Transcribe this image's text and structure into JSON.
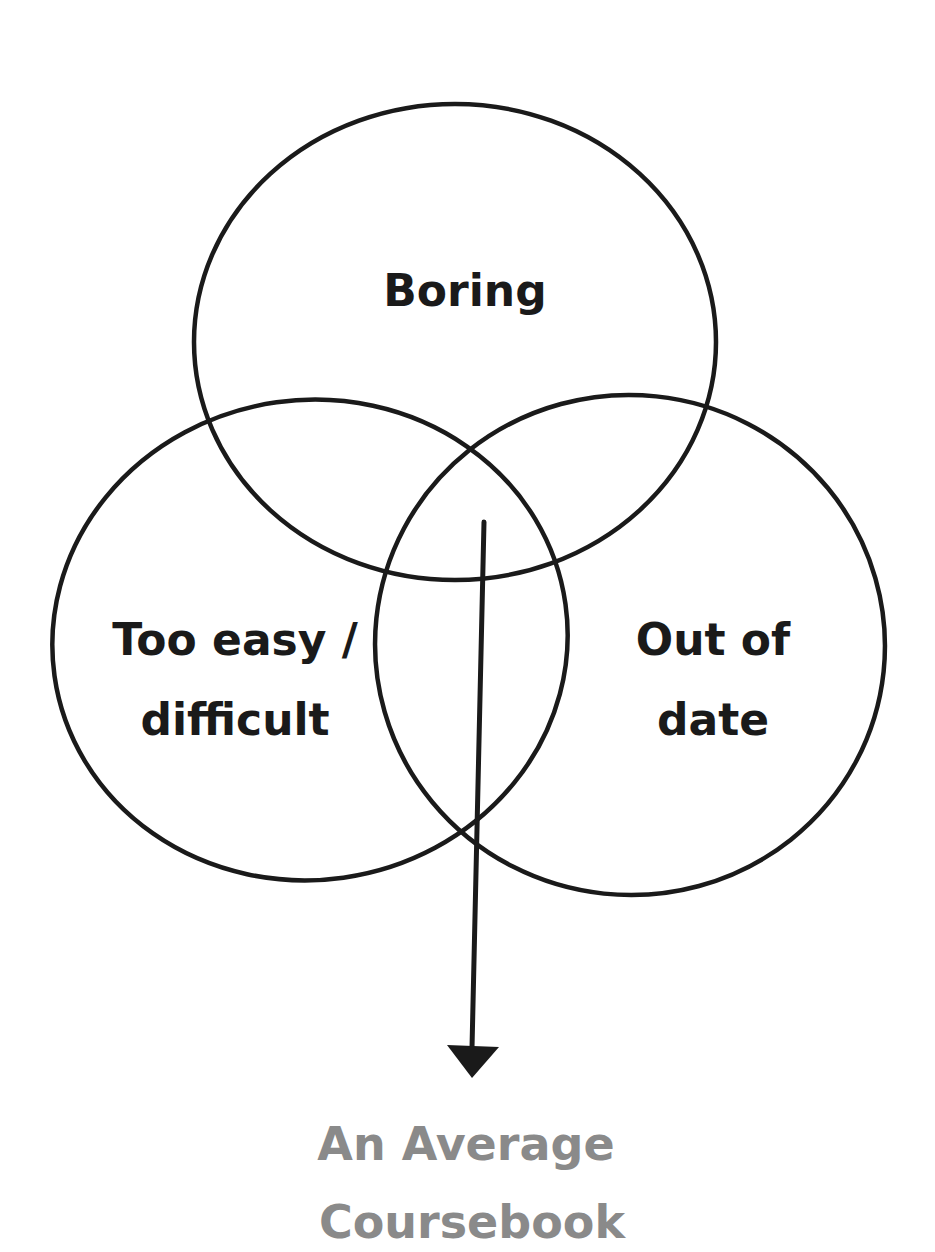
{
  "diagram": {
    "type": "venn",
    "circles": [
      {
        "label": "Boring",
        "lines": [
          "Boring"
        ]
      },
      {
        "label": "Too easy / difficult",
        "lines": [
          "Too easy /",
          "difficult"
        ]
      },
      {
        "label": "Out of date",
        "lines": [
          "Out of",
          "date"
        ]
      }
    ],
    "result": {
      "label": "An Average Coursebook",
      "lines": [
        "An Average",
        "Coursebook"
      ],
      "color": "#8a8a8a"
    },
    "stroke_color": "#1a1a1a"
  }
}
